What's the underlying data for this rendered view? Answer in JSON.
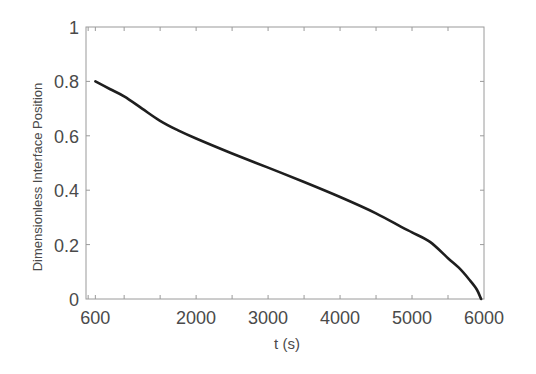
{
  "chart_data": {
    "type": "line",
    "title": "",
    "xlabel": "t (s)",
    "ylabel": "Dimensionless Interface Position",
    "xlim": [
      470,
      6000
    ],
    "ylim": [
      0,
      1
    ],
    "grid": false,
    "legend": null,
    "x_ticks": [
      600,
      2000,
      3000,
      4000,
      5000,
      6000
    ],
    "x_tick_labels": [
      "600",
      "2000",
      "3000",
      "4000",
      "5000",
      "6000"
    ],
    "x_minor_tick_step": 500,
    "y_ticks": [
      0,
      0.2,
      0.4,
      0.6,
      0.8,
      1
    ],
    "y_tick_labels": [
      "0",
      "0.2",
      "0.4",
      "0.6",
      "0.8",
      "1"
    ],
    "series": [
      {
        "name": "Dimensionless Interface Position",
        "color": "#1e1e1e",
        "x": [
          600,
          800,
          1000,
          1250,
          1500,
          1750,
          2000,
          2500,
          3000,
          3500,
          4000,
          4500,
          4850,
          5000,
          5250,
          5500,
          5650,
          5800,
          5900,
          5960
        ],
        "y": [
          0.8,
          0.772,
          0.745,
          0.7,
          0.655,
          0.62,
          0.59,
          0.535,
          0.483,
          0.43,
          0.375,
          0.315,
          0.265,
          0.245,
          0.21,
          0.15,
          0.115,
          0.07,
          0.035,
          0.0
        ]
      }
    ]
  }
}
